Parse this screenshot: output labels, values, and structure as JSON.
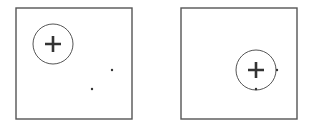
{
  "colors": {
    "stroke": "#555555",
    "plus": "#333333",
    "dot": "#333333",
    "background": "#ffffff"
  },
  "panels": [
    {
      "name": "left-panel",
      "box": {
        "x": 16,
        "y": 8,
        "w": 116,
        "h": 111
      },
      "circle": {
        "cx": 53,
        "cy": 44,
        "r": 20
      },
      "plus": {
        "cx": 53,
        "cy": 44,
        "size": 8
      },
      "dots": [
        {
          "cx": 112,
          "cy": 70
        },
        {
          "cx": 92,
          "cy": 89
        }
      ]
    },
    {
      "name": "right-panel",
      "box": {
        "x": 181,
        "y": 8,
        "w": 116,
        "h": 111
      },
      "circle": {
        "cx": 256,
        "cy": 70,
        "r": 20
      },
      "plus": {
        "cx": 256,
        "cy": 70,
        "size": 8
      },
      "dots": [
        {
          "cx": 277,
          "cy": 70
        },
        {
          "cx": 256,
          "cy": 89
        }
      ]
    }
  ]
}
